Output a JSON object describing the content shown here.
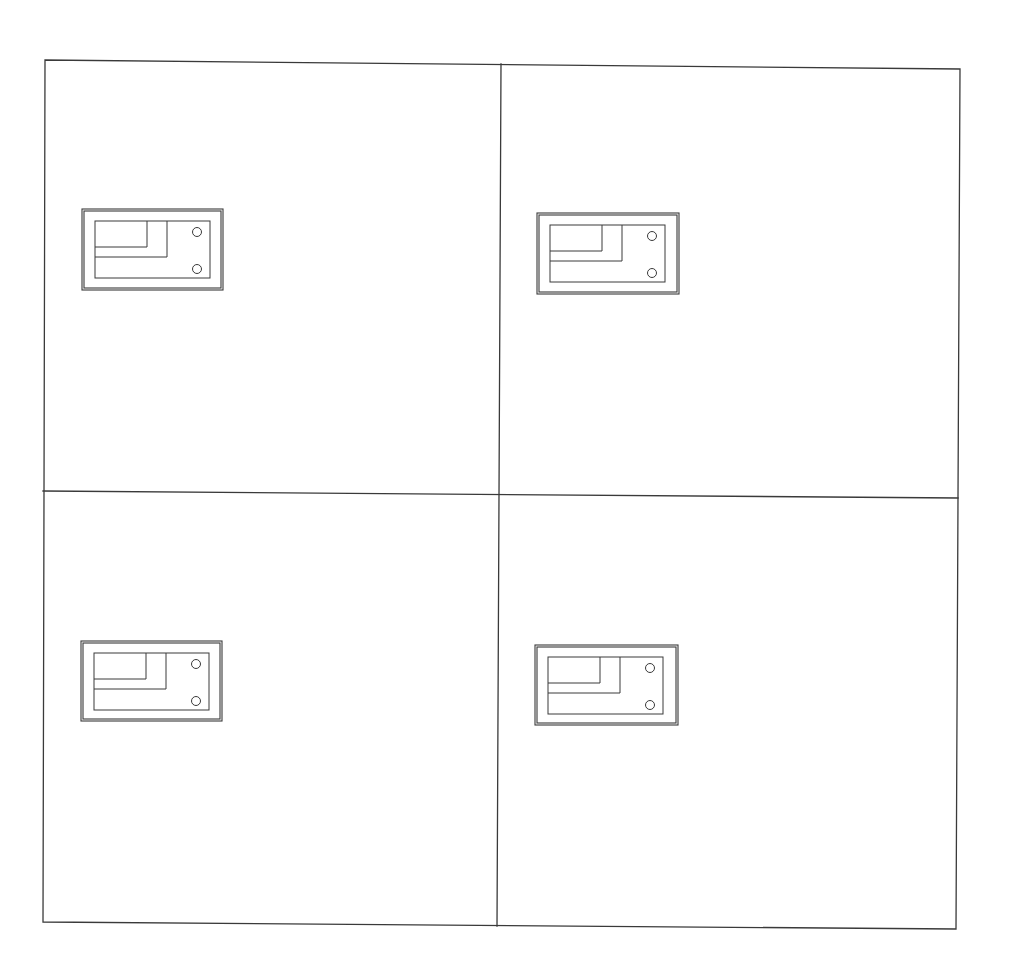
{
  "diagram": {
    "type": "grid-layout-drawing",
    "background": "#ffffff",
    "line_color": "#3a3a3a",
    "frame": {
      "corners": {
        "top_left": [
          45,
          60
        ],
        "top_right": [
          960,
          69
        ],
        "bottom_right": [
          956,
          929
        ],
        "bottom_left": [
          43,
          922
        ]
      },
      "vertical_divider": {
        "top": [
          501,
          64
        ],
        "bottom": [
          497,
          926
        ]
      },
      "horizontal_divider": {
        "left": [
          43,
          491
        ],
        "right": [
          958,
          498
        ]
      }
    },
    "quadrants": [
      {
        "id": "top-left",
        "label": ""
      },
      {
        "id": "top-right",
        "label": ""
      },
      {
        "id": "bottom-left",
        "label": ""
      },
      {
        "id": "bottom-right",
        "label": ""
      }
    ],
    "symbols": [
      {
        "quadrant": "top-left",
        "x": 82,
        "y": 209,
        "w": 141,
        "h": 81
      },
      {
        "quadrant": "top-right",
        "x": 537,
        "y": 213,
        "w": 142,
        "h": 81
      },
      {
        "quadrant": "bottom-left",
        "x": 81,
        "y": 641,
        "w": 141,
        "h": 80
      },
      {
        "quadrant": "bottom-right",
        "x": 535,
        "y": 645,
        "w": 143,
        "h": 80
      }
    ],
    "symbol_template": {
      "name": "component-symbol",
      "outer_double_border_gap": 2,
      "inner_rect": {
        "dx": 13,
        "dy": 12,
        "w": 115,
        "h": 57
      },
      "step_lines": [
        {
          "vx": 65,
          "vy_end": 38
        },
        {
          "vx": 85,
          "vy_end": 48
        }
      ],
      "holes": [
        {
          "cx": 115,
          "cy": 23,
          "r": 4.5
        },
        {
          "cx": 115,
          "cy": 60,
          "r": 4.5
        }
      ]
    }
  }
}
